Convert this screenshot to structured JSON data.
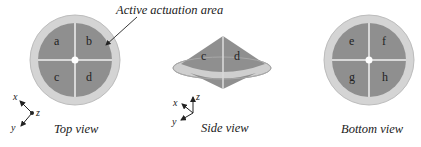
{
  "annotation": {
    "label": "Active actuation area"
  },
  "colors": {
    "ring": "#d4d4d4",
    "ring_edge": "#b8b8b8",
    "area": "#8f8f8f",
    "divider": "#d8d8d8",
    "center": "#ffffff",
    "text": "#222222"
  },
  "top_view": {
    "caption": "Top view",
    "quadrants": [
      "a",
      "b",
      "c",
      "d"
    ],
    "axes": {
      "x": "x",
      "y": "y",
      "z": "z"
    }
  },
  "side_view": {
    "caption": "Side view",
    "segments": [
      "c",
      "d"
    ],
    "axes": {
      "x": "x",
      "y": "y",
      "z": "z"
    }
  },
  "bottom_view": {
    "caption": "Bottom view",
    "quadrants": [
      "e",
      "f",
      "g",
      "h"
    ]
  }
}
